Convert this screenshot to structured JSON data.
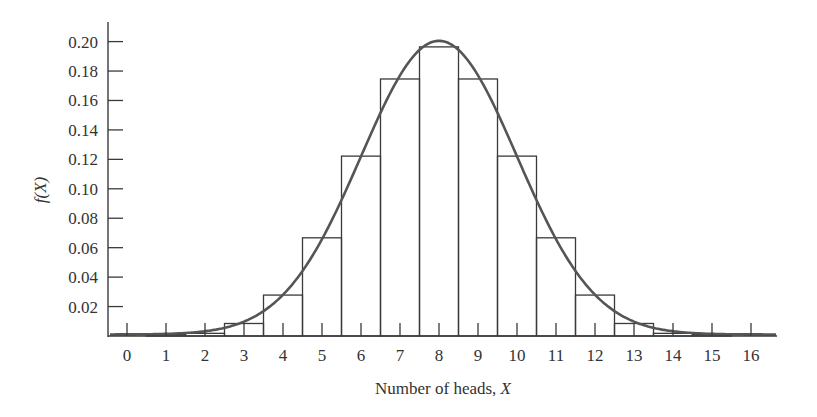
{
  "chart_data": {
    "type": "bar",
    "subtype": "histogram-with-normal-curve",
    "title": "",
    "xlabel": "Number of heads, X",
    "xlabel_plain": "Number of heads, ",
    "xlabel_var": "X",
    "ylabel": "f(X)",
    "x": [
      0,
      1,
      2,
      3,
      4,
      5,
      6,
      7,
      8,
      9,
      10,
      11,
      12,
      13,
      14,
      15,
      16
    ],
    "categories": [
      "0",
      "1",
      "2",
      "3",
      "4",
      "5",
      "6",
      "7",
      "8",
      "9",
      "10",
      "11",
      "12",
      "13",
      "14",
      "15",
      "16"
    ],
    "values": [
      0.0,
      0.0002,
      0.0018,
      0.0085,
      0.0278,
      0.0667,
      0.1222,
      0.1746,
      0.1964,
      0.1746,
      0.1222,
      0.0667,
      0.0278,
      0.0085,
      0.0018,
      0.0002,
      0.0
    ],
    "series": [
      {
        "name": "Binomial f(X), n=16, p=0.5",
        "kind": "bar",
        "values": [
          0.0,
          0.0002,
          0.0018,
          0.0085,
          0.0278,
          0.0667,
          0.1222,
          0.1746,
          0.1964,
          0.1746,
          0.1222,
          0.0667,
          0.0278,
          0.0085,
          0.0018,
          0.0002,
          0.0
        ]
      },
      {
        "name": "Normal approximation",
        "kind": "line",
        "mean": 8,
        "sd": 2
      }
    ],
    "yticks": [
      "0.02",
      "0.04",
      "0.06",
      "0.08",
      "0.10",
      "0.12",
      "0.14",
      "0.16",
      "0.18",
      "0.20"
    ],
    "ytick_values": [
      0.02,
      0.04,
      0.06,
      0.08,
      0.1,
      0.12,
      0.14,
      0.16,
      0.18,
      0.2
    ],
    "xticks": [
      "0",
      "1",
      "2",
      "3",
      "4",
      "5",
      "6",
      "7",
      "8",
      "9",
      "10",
      "11",
      "12",
      "13",
      "14",
      "15",
      "16"
    ],
    "xlim": [
      -0.5,
      16.7
    ],
    "ylim": [
      0,
      0.21
    ],
    "grid": false,
    "legend": "none"
  },
  "colors": {
    "bar_stroke": "#3a3a3a",
    "curve": "#555555",
    "axis": "#3a3a3a",
    "text": "#333333"
  }
}
